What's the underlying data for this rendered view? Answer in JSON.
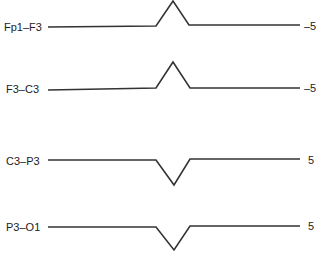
{
  "channels": [
    {
      "name": "Fp1–F3",
      "polarity_label": "–5",
      "deflection": "positive (upward)"
    },
    {
      "name": "F3–C3",
      "polarity_label": "–5",
      "deflection": "positive (upward)"
    },
    {
      "name": "C3–P3",
      "polarity_label": "5",
      "deflection": "negative (downward)"
    },
    {
      "name": "P3–O1",
      "polarity_label": "5",
      "deflection": "negative (downward)"
    }
  ],
  "colors": {
    "trace": "#333333",
    "text": "#222222",
    "background": "#ffffff"
  }
}
